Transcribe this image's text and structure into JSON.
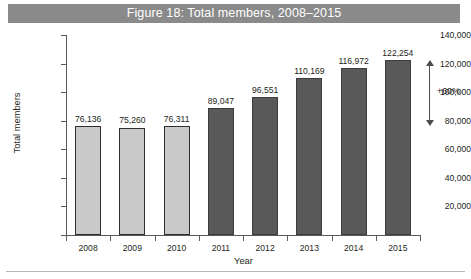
{
  "figure": {
    "title": "Figure 18: Total members, 2008–2015",
    "title_band_color": "#8a8a8a",
    "title_text_color": "#ffffff",
    "background_color": "#ffffff"
  },
  "annotation": {
    "growth_label": "+60%",
    "arrow_icon": "double-headed-vertical-arrow"
  },
  "chart_data": {
    "type": "bar",
    "title": "Figure 18: Total members, 2008–2015",
    "xlabel": "Year",
    "ylabel": "Total members",
    "categories": [
      "2008",
      "2009",
      "2010",
      "2011",
      "2012",
      "2013",
      "2014",
      "2015"
    ],
    "values": [
      76136,
      75260,
      76311,
      89047,
      96551,
      110169,
      116972,
      122254
    ],
    "value_labels": [
      "76,136",
      "75,260",
      "76,311",
      "89,047",
      "96,551",
      "110,169",
      "116,972",
      "122,254"
    ],
    "bar_colors": [
      "#c9c9c9",
      "#c9c9c9",
      "#c9c9c9",
      "#595959",
      "#595959",
      "#595959",
      "#595959",
      "#595959"
    ],
    "series": [
      {
        "name": "Total members",
        "values": [
          76136,
          75260,
          76311,
          89047,
          96551,
          110169,
          116972,
          122254
        ]
      }
    ],
    "ylim": [
      0,
      140000
    ],
    "ytick_values": [
      20000,
      40000,
      60000,
      80000,
      100000,
      120000,
      140000
    ],
    "ytick_labels": [
      "20,000",
      "40,000",
      "60,000",
      "80,000",
      "100,000",
      "120,000",
      "140,000"
    ],
    "grid": false,
    "legend": null,
    "annotations": [
      {
        "text": "+60%",
        "type": "double-headed-arrow",
        "from_value": 76136,
        "to_value": 122254
      }
    ]
  }
}
